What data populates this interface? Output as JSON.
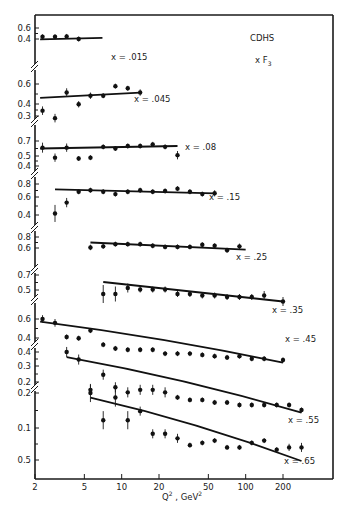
{
  "chart_data": {
    "type": "scatter",
    "title": "CDHS",
    "subtitle": "x F3",
    "xlabel": "Q² , GeV²",
    "ylabel": "x F3",
    "xscale": "log",
    "xlim": [
      2,
      320
    ],
    "xticks": [
      2,
      5,
      10,
      20,
      50,
      100,
      200
    ],
    "xtick_labels": [
      "2",
      "5",
      "10",
      "20",
      "50",
      "100",
      "200"
    ],
    "grid": false,
    "legend": "none",
    "note": "Stacked panels with broken y-axis; each panel is a different x bin with data points (with error bars) and a QCD fit curve",
    "panels": [
      {
        "name": "x = .015",
        "label": "x = .015",
        "yticks": [
          0.4,
          0.6
        ],
        "points": [
          {
            "q2": 2.3,
            "y": 0.36,
            "err": 0.04
          },
          {
            "q2": 2.9,
            "y": 0.36,
            "err": 0.03
          },
          {
            "q2": 3.6,
            "y": 0.37,
            "err": 0.04
          },
          {
            "q2": 4.5,
            "y": 0.3,
            "err": 0.02
          }
        ],
        "fit": [
          {
            "q2": 2.2,
            "y": 0.29
          },
          {
            "q2": 7.0,
            "y": 0.33
          }
        ]
      },
      {
        "name": "x = .045",
        "label": "x = .045",
        "yticks": [
          0.3,
          0.4,
          0.6
        ],
        "points": [
          {
            "q2": 2.3,
            "y": 0.35,
            "err": 0.04
          },
          {
            "q2": 2.9,
            "y": 0.28,
            "err": 0.04
          },
          {
            "q2": 3.6,
            "y": 0.52,
            "err": 0.04
          },
          {
            "q2": 4.5,
            "y": 0.41,
            "err": 0.03
          },
          {
            "q2": 5.6,
            "y": 0.49,
            "err": 0.03
          },
          {
            "q2": 7.1,
            "y": 0.49,
            "err": 0.02
          },
          {
            "q2": 8.9,
            "y": 0.58,
            "err": 0.02
          },
          {
            "q2": 11.2,
            "y": 0.56,
            "err": 0.02
          },
          {
            "q2": 14.1,
            "y": 0.52,
            "err": 0.03
          }
        ],
        "fit": [
          {
            "q2": 2.2,
            "y": 0.47
          },
          {
            "q2": 14.1,
            "y": 0.52
          }
        ]
      },
      {
        "name": "x = .08",
        "label": "x = .08",
        "yticks": [
          0.4,
          0.5,
          0.7
        ],
        "points": [
          {
            "q2": 2.3,
            "y": 0.62,
            "err": 0.06
          },
          {
            "q2": 2.9,
            "y": 0.5,
            "err": 0.05
          },
          {
            "q2": 3.6,
            "y": 0.62,
            "err": 0.05
          },
          {
            "q2": 4.5,
            "y": 0.49,
            "err": 0.03
          },
          {
            "q2": 5.6,
            "y": 0.5,
            "err": 0.03
          },
          {
            "q2": 7.1,
            "y": 0.63,
            "err": 0.03
          },
          {
            "q2": 8.9,
            "y": 0.61,
            "err": 0.03
          },
          {
            "q2": 11.2,
            "y": 0.64,
            "err": 0.02
          },
          {
            "q2": 14.1,
            "y": 0.64,
            "err": 0.02
          },
          {
            "q2": 17.8,
            "y": 0.66,
            "err": 0.02
          },
          {
            "q2": 22.4,
            "y": 0.63,
            "err": 0.02
          },
          {
            "q2": 28.2,
            "y": 0.53,
            "err": 0.05
          }
        ],
        "fit": [
          {
            "q2": 2.2,
            "y": 0.61
          },
          {
            "q2": 28.2,
            "y": 0.64
          }
        ]
      },
      {
        "name": "x = .15",
        "label": "x = .15",
        "yticks": [
          0.4,
          0.6,
          0.8
        ],
        "points": [
          {
            "q2": 2.9,
            "y": 0.42,
            "err": 0.11
          },
          {
            "q2": 3.6,
            "y": 0.56,
            "err": 0.06
          },
          {
            "q2": 4.5,
            "y": 0.7,
            "err": 0.03
          },
          {
            "q2": 5.6,
            "y": 0.72,
            "err": 0.02
          },
          {
            "q2": 7.1,
            "y": 0.7,
            "err": 0.02
          },
          {
            "q2": 8.9,
            "y": 0.67,
            "err": 0.02
          },
          {
            "q2": 11.2,
            "y": 0.7,
            "err": 0.02
          },
          {
            "q2": 14.1,
            "y": 0.72,
            "err": 0.02
          },
          {
            "q2": 17.8,
            "y": 0.7,
            "err": 0.02
          },
          {
            "q2": 22.4,
            "y": 0.71,
            "err": 0.02
          },
          {
            "q2": 28.2,
            "y": 0.74,
            "err": 0.02
          },
          {
            "q2": 35.5,
            "y": 0.7,
            "err": 0.02
          },
          {
            "q2": 44.7,
            "y": 0.67,
            "err": 0.02
          },
          {
            "q2": 56.2,
            "y": 0.68,
            "err": 0.04
          }
        ],
        "fit": [
          {
            "q2": 2.9,
            "y": 0.73
          },
          {
            "q2": 56.2,
            "y": 0.68
          }
        ]
      },
      {
        "name": "x = .25",
        "label": "x = .25",
        "yticks": [
          0.6,
          0.8
        ],
        "points": [
          {
            "q2": 5.6,
            "y": 0.61,
            "err": 0.05
          },
          {
            "q2": 7.1,
            "y": 0.63,
            "err": 0.04
          },
          {
            "q2": 8.9,
            "y": 0.67,
            "err": 0.03
          },
          {
            "q2": 11.2,
            "y": 0.67,
            "err": 0.03
          },
          {
            "q2": 14.1,
            "y": 0.67,
            "err": 0.02
          },
          {
            "q2": 17.8,
            "y": 0.64,
            "err": 0.02
          },
          {
            "q2": 22.4,
            "y": 0.62,
            "err": 0.02
          },
          {
            "q2": 28.2,
            "y": 0.62,
            "err": 0.02
          },
          {
            "q2": 35.5,
            "y": 0.62,
            "err": 0.02
          },
          {
            "q2": 44.7,
            "y": 0.66,
            "err": 0.02
          },
          {
            "q2": 56.2,
            "y": 0.64,
            "err": 0.02
          },
          {
            "q2": 70.8,
            "y": 0.56,
            "err": 0.02
          },
          {
            "q2": 89.1,
            "y": 0.63,
            "err": 0.05
          }
        ],
        "fit": [
          {
            "q2": 5.6,
            "y": 0.7
          },
          {
            "q2": 100,
            "y": 0.57
          }
        ]
      },
      {
        "name": "x = .35",
        "label": "x = .35",
        "yticks": [
          0.5,
          0.7
        ],
        "points": [
          {
            "q2": 7.1,
            "y": 0.47,
            "err": 0.06
          },
          {
            "q2": 8.9,
            "y": 0.47,
            "err": 0.05
          },
          {
            "q2": 11.2,
            "y": 0.51,
            "err": 0.03
          },
          {
            "q2": 14.1,
            "y": 0.5,
            "err": 0.02
          },
          {
            "q2": 17.8,
            "y": 0.5,
            "err": 0.02
          },
          {
            "q2": 22.4,
            "y": 0.5,
            "err": 0.02
          },
          {
            "q2": 28.2,
            "y": 0.47,
            "err": 0.02
          },
          {
            "q2": 35.5,
            "y": 0.47,
            "err": 0.02
          },
          {
            "q2": 44.7,
            "y": 0.46,
            "err": 0.02
          },
          {
            "q2": 56.2,
            "y": 0.46,
            "err": 0.02
          },
          {
            "q2": 70.8,
            "y": 0.45,
            "err": 0.02
          },
          {
            "q2": 89.1,
            "y": 0.45,
            "err": 0.02
          },
          {
            "q2": 112,
            "y": 0.45,
            "err": 0.02
          },
          {
            "q2": 141,
            "y": 0.46,
            "err": 0.03
          },
          {
            "q2": 200,
            "y": 0.42,
            "err": 0.03
          }
        ],
        "fit": [
          {
            "q2": 7.1,
            "y": 0.55
          },
          {
            "q2": 200,
            "y": 0.42
          }
        ]
      },
      {
        "name": "x = .45",
        "label": "x = .45",
        "yticks": [
          0.4,
          0.6
        ],
        "points": [
          {
            "q2": 2.3,
            "y": 0.6,
            "err": 0.03
          },
          {
            "q2": 2.9,
            "y": 0.57,
            "err": 0.03
          },
          {
            "q2": 3.6,
            "y": 0.46,
            "err": 0.02
          },
          {
            "q2": 4.5,
            "y": 0.45,
            "err": 0.02
          },
          {
            "q2": 5.6,
            "y": 0.51,
            "err": 0.02
          },
          {
            "q2": 7.1,
            "y": 0.4,
            "err": 0.02
          },
          {
            "q2": 8.9,
            "y": 0.37,
            "err": 0.02
          },
          {
            "q2": 11.2,
            "y": 0.36,
            "err": 0.02
          },
          {
            "q2": 14.1,
            "y": 0.36,
            "err": 0.02
          },
          {
            "q2": 17.8,
            "y": 0.36,
            "err": 0.02
          },
          {
            "q2": 22.4,
            "y": 0.33,
            "err": 0.02
          },
          {
            "q2": 28.2,
            "y": 0.33,
            "err": 0.02
          },
          {
            "q2": 35.5,
            "y": 0.33,
            "err": 0.02
          },
          {
            "q2": 44.7,
            "y": 0.32,
            "err": 0.02
          },
          {
            "q2": 56.2,
            "y": 0.31,
            "err": 0.02
          },
          {
            "q2": 70.8,
            "y": 0.3,
            "err": 0.02
          },
          {
            "q2": 89.1,
            "y": 0.31,
            "err": 0.02
          },
          {
            "q2": 112,
            "y": 0.29,
            "err": 0.02
          },
          {
            "q2": 141,
            "y": 0.29,
            "err": 0.02
          },
          {
            "q2": 200,
            "y": 0.28,
            "err": 0.02
          }
        ],
        "fit": [
          {
            "q2": 2.2,
            "y": 0.58
          },
          {
            "q2": 200,
            "y": 0.26
          }
        ]
      },
      {
        "name": "x = .55",
        "label": "x = .55",
        "yticks": [
          0.2,
          0.3,
          0.4
        ],
        "points": [
          {
            "q2": 3.6,
            "y": 0.41,
            "err": 0.02
          },
          {
            "q2": 4.5,
            "y": 0.38,
            "err": 0.02
          },
          {
            "q2": 5.6,
            "y": 0.26,
            "err": 0.02
          },
          {
            "q2": 7.1,
            "y": 0.32,
            "err": 0.02
          },
          {
            "q2": 8.9,
            "y": 0.27,
            "err": 0.02
          },
          {
            "q2": 11.2,
            "y": 0.25,
            "err": 0.02
          },
          {
            "q2": 14.1,
            "y": 0.26,
            "err": 0.02
          },
          {
            "q2": 17.8,
            "y": 0.26,
            "err": 0.02
          },
          {
            "q2": 22.4,
            "y": 0.25,
            "err": 0.02
          },
          {
            "q2": 28.2,
            "y": 0.23,
            "err": 0.01
          },
          {
            "q2": 35.5,
            "y": 0.22,
            "err": 0.01
          },
          {
            "q2": 44.7,
            "y": 0.22,
            "err": 0.01
          },
          {
            "q2": 56.2,
            "y": 0.21,
            "err": 0.01
          },
          {
            "q2": 70.8,
            "y": 0.21,
            "err": 0.01
          },
          {
            "q2": 89.1,
            "y": 0.2,
            "err": 0.01
          },
          {
            "q2": 112,
            "y": 0.2,
            "err": 0.01
          },
          {
            "q2": 141,
            "y": 0.2,
            "err": 0.01
          },
          {
            "q2": 178,
            "y": 0.2,
            "err": 0.01
          },
          {
            "q2": 224,
            "y": 0.2,
            "err": 0.01
          },
          {
            "q2": 282,
            "y": 0.18,
            "err": 0.01
          }
        ],
        "fit": [
          {
            "q2": 3.6,
            "y": 0.39
          },
          {
            "q2": 282,
            "y": 0.17
          }
        ]
      },
      {
        "name": "x = .65",
        "label": "x = .65",
        "yticks": [
          0.5,
          0.1,
          0.2
        ],
        "ytick_labels": [
          "0.5",
          "0.1",
          "0.2"
        ],
        "points": [
          {
            "q2": 5.6,
            "y": 0.2,
            "err": 0.02
          },
          {
            "q2": 7.1,
            "y": 0.14,
            "err": 0.02
          },
          {
            "q2": 8.9,
            "y": 0.19,
            "err": 0.02
          },
          {
            "q2": 11.2,
            "y": 0.14,
            "err": 0.02
          },
          {
            "q2": 14.1,
            "y": 0.16,
            "err": 0.01
          },
          {
            "q2": 17.8,
            "y": 0.11,
            "err": 0.01
          },
          {
            "q2": 22.4,
            "y": 0.11,
            "err": 0.01
          },
          {
            "q2": 28.2,
            "y": 0.1,
            "err": 0.01
          },
          {
            "q2": 35.5,
            "y": 0.085,
            "err": 0.005
          },
          {
            "q2": 44.7,
            "y": 0.09,
            "err": 0.005
          },
          {
            "q2": 56.2,
            "y": 0.095,
            "err": 0.005
          },
          {
            "q2": 70.8,
            "y": 0.08,
            "err": 0.005
          },
          {
            "q2": 89.1,
            "y": 0.08,
            "err": 0.005
          },
          {
            "q2": 112,
            "y": 0.09,
            "err": 0.005
          },
          {
            "q2": 141,
            "y": 0.095,
            "err": 0.005
          },
          {
            "q2": 178,
            "y": 0.075,
            "err": 0.005
          },
          {
            "q2": 224,
            "y": 0.08,
            "err": 0.008
          },
          {
            "q2": 282,
            "y": 0.08,
            "err": 0.01
          }
        ],
        "fit": [
          {
            "q2": 5.6,
            "y": 0.19
          },
          {
            "q2": 282,
            "y": 0.05
          }
        ]
      }
    ]
  },
  "labels": {
    "experiment": "CDHS",
    "structure_function": "x F",
    "structure_function_sub": "3",
    "x_axis_title_base": "Q",
    "x_axis_title_sup": "2",
    "x_axis_title_unit": " , GeV",
    "x_axis_title_unit_sup": "2"
  },
  "layout": {
    "frame": {
      "left": 35,
      "right": 333,
      "top": 15,
      "bottom": 479
    },
    "log_x0": 2,
    "px_x0": 35,
    "px_per_decade": 124,
    "panel_pixels": [
      {
        "ymap": [
          [
            0.3,
            39
          ],
          [
            0.6,
            28
          ]
        ],
        "ticks_px": [
          [
            0.6,
            28
          ],
          [
            0.4,
            39
          ]
        ],
        "label_px": [
          111,
          60
        ],
        "break_y": 67,
        "break_from": 67
      },
      {
        "ymap": [
          [
            0.3,
            116
          ],
          [
            0.6,
            84
          ]
        ],
        "ticks_px": [
          [
            0.6,
            84
          ],
          [
            0.4,
            104
          ],
          [
            0.3,
            116
          ]
        ],
        "label_px": [
          134,
          102
        ],
        "break_y": 122
      },
      {
        "ymap": [
          [
            0.4,
            166
          ],
          [
            0.7,
            141
          ]
        ],
        "ticks_px": [
          [
            0.7,
            141
          ],
          [
            0.5,
            156
          ],
          [
            0.4,
            166
          ]
        ],
        "label_px": [
          185,
          150
        ],
        "break_y": 174
      },
      {
        "ymap": [
          [
            0.4,
            215
          ],
          [
            0.8,
            184
          ]
        ],
        "ticks_px": [
          [
            0.8,
            184
          ],
          [
            0.6,
            197
          ],
          [
            0.4,
            215
          ]
        ],
        "label_px": [
          209,
          200
        ],
        "break_y": 228
      },
      {
        "ymap": [
          [
            0.6,
            248
          ],
          [
            0.8,
            237
          ]
        ],
        "ticks_px": [
          [
            0.8,
            237
          ],
          [
            0.6,
            248
          ]
        ],
        "label_px": [
          236,
          260
        ],
        "break_y": 270
      },
      {
        "ymap": [
          [
            0.45,
            297
          ],
          [
            0.55,
            282
          ]
        ],
        "ticks_px": [
          [
            0.7,
            275
          ],
          [
            0.5,
            290
          ]
        ],
        "label_px": [
          272,
          313
        ],
        "break_y": 300
      },
      {
        "ymap": [
          [
            0.28,
            360
          ],
          [
            0.6,
            319
          ]
        ],
        "ticks_px": [
          [
            0.6,
            319
          ],
          [
            0.4,
            338
          ]
        ],
        "label_px": [
          285,
          342
        ],
        "break_y": 345
      },
      {
        "ymap": [
          [
            0.18,
            410
          ],
          [
            0.41,
            352
          ]
        ],
        "ticks_px": [
          [
            0.4,
            352
          ],
          [
            0.3,
            366
          ],
          [
            0.2,
            382
          ]
        ],
        "label_px": [
          288,
          423
        ],
        "break_y": 388
      },
      {
        "ymap": [
          [
            0.05,
            461
          ],
          [
            0.2,
            393
          ]
        ],
        "ticks_px": [
          [
            0.2,
            393
          ],
          [
            0.1,
            428
          ],
          [
            0.5,
            460
          ]
        ],
        "label_px": [
          284,
          464
        ]
      }
    ]
  }
}
